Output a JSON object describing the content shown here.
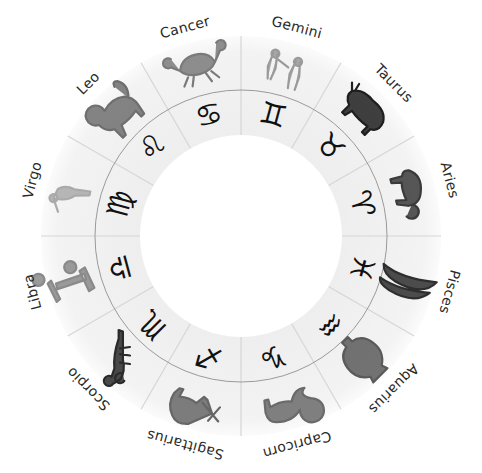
{
  "wheel": {
    "center": [
      241,
      236
    ],
    "outer_radius": 200,
    "ring_radius": 146,
    "inner_radius": 101,
    "label_radius": 216,
    "colors": {
      "disc_fill": "#f2f2f2",
      "disc_edge": "#fafafa",
      "divider": "#d6d6d6",
      "ring_line": "#9a9a9a",
      "center_fill": "#ffffff",
      "glyph": "#111111",
      "label": "#2a2a2a"
    }
  },
  "signs": [
    {
      "name": "Gemini",
      "glyph": "♊",
      "angle": 15,
      "figure": "twins",
      "shade": "#9a9a9a"
    },
    {
      "name": "Taurus",
      "glyph": "♉",
      "angle": 45,
      "figure": "bull",
      "shade": "#1e1e1e"
    },
    {
      "name": "Aries",
      "glyph": "♈",
      "angle": 75,
      "figure": "ram",
      "shade": "#3a3a3a"
    },
    {
      "name": "Pisces",
      "glyph": "♓",
      "angle": 105,
      "figure": "fish",
      "shade": "#2e2e2e"
    },
    {
      "name": "Aquarius",
      "glyph": "♒",
      "angle": 135,
      "figure": "urn",
      "shade": "#5a5a5a"
    },
    {
      "name": "Capricorn",
      "glyph": "♑",
      "angle": 165,
      "figure": "sea-goat",
      "shade": "#6a6a6a"
    },
    {
      "name": "Sagittarius",
      "glyph": "♐",
      "angle": 195,
      "figure": "centaur",
      "shade": "#666666"
    },
    {
      "name": "Scorpio",
      "glyph": "♏",
      "angle": 225,
      "figure": "scorpion",
      "shade": "#2a2a2a"
    },
    {
      "name": "Libra",
      "glyph": "♎",
      "angle": 255,
      "figure": "scales",
      "shade": "#8a8a8a"
    },
    {
      "name": "Virgo",
      "glyph": "♍",
      "angle": 285,
      "figure": "maiden",
      "shade": "#aaaaaa"
    },
    {
      "name": "Leo",
      "glyph": "♌",
      "angle": 315,
      "figure": "lion",
      "shade": "#6e6e6e"
    },
    {
      "name": "Cancer",
      "glyph": "♋",
      "angle": 345,
      "figure": "crab",
      "shade": "#7a7a7a"
    }
  ]
}
